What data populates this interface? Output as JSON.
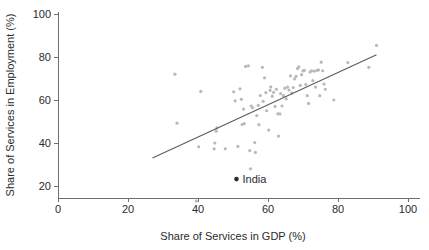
{
  "chart_data": {
    "type": "scatter",
    "title": "",
    "xlabel": "Share of Services in GDP (%)",
    "ylabel": "Share of Services in Employment (%)",
    "xlim": [
      0,
      100
    ],
    "ylim": [
      10,
      103
    ],
    "grid": false,
    "legend": null,
    "xticks": [
      0,
      20,
      40,
      60,
      80,
      100
    ],
    "yticks": [
      20,
      40,
      60,
      80,
      100
    ],
    "xtick_labels": [
      "0",
      "20",
      "40",
      "60",
      "80",
      "100"
    ],
    "ytick_labels": [
      "20",
      "40",
      "60",
      "80",
      "100"
    ],
    "point_color": "#b9b9b9",
    "highlight_color": "#2b2b2b",
    "line_color": "#5b5b66",
    "series": [
      {
        "name": "countries",
        "points": [
          [
            33.4,
            72.0
          ],
          [
            40.8,
            64.0
          ],
          [
            39.5,
            13.0
          ],
          [
            40.2,
            38.2
          ],
          [
            44.8,
            40.0
          ],
          [
            44.6,
            37.3
          ],
          [
            45.2,
            45.5
          ],
          [
            45.4,
            47.0
          ],
          [
            47.8,
            37.3
          ],
          [
            34.0,
            49.2
          ],
          [
            50.2,
            63.8
          ],
          [
            50.6,
            59.6
          ],
          [
            51.4,
            38.4
          ],
          [
            52.0,
            65.2
          ],
          [
            52.4,
            60.3
          ],
          [
            52.6,
            48.6
          ],
          [
            53.2,
            49.0
          ],
          [
            53.0,
            55.8
          ],
          [
            53.6,
            75.6
          ],
          [
            54.4,
            75.9
          ],
          [
            54.8,
            36.5
          ],
          [
            55.0,
            28.0
          ],
          [
            55.2,
            57.2
          ],
          [
            55.6,
            56.4
          ],
          [
            56.2,
            40.2
          ],
          [
            56.4,
            35.6
          ],
          [
            56.8,
            52.8
          ],
          [
            57.2,
            57.5
          ],
          [
            57.4,
            48.5
          ],
          [
            57.8,
            62.1
          ],
          [
            58.4,
            75.2
          ],
          [
            58.6,
            59.4
          ],
          [
            59.0,
            70.3
          ],
          [
            59.4,
            63.4
          ],
          [
            59.6,
            55.0
          ],
          [
            60.2,
            46.0
          ],
          [
            60.6,
            64.5
          ],
          [
            60.8,
            66.1
          ],
          [
            61.2,
            61.8
          ],
          [
            61.6,
            63.6
          ],
          [
            62.0,
            57.0
          ],
          [
            62.4,
            65.0
          ],
          [
            62.8,
            53.6
          ],
          [
            63.0,
            43.2
          ],
          [
            63.4,
            53.5
          ],
          [
            63.6,
            63.0
          ],
          [
            64.0,
            57.2
          ],
          [
            64.4,
            62.0
          ],
          [
            64.8,
            65.5
          ],
          [
            65.2,
            60.5
          ],
          [
            65.6,
            66.0
          ],
          [
            66.0,
            64.6
          ],
          [
            66.4,
            71.2
          ],
          [
            66.8,
            63.2
          ],
          [
            67.2,
            65.8
          ],
          [
            67.6,
            69.8
          ],
          [
            68.0,
            71.0
          ],
          [
            68.4,
            74.6
          ],
          [
            68.8,
            75.4
          ],
          [
            69.2,
            66.8
          ],
          [
            69.6,
            71.8
          ],
          [
            70.0,
            73.5
          ],
          [
            70.4,
            73.8
          ],
          [
            70.8,
            67.2
          ],
          [
            71.2,
            62.0
          ],
          [
            71.6,
            58.4
          ],
          [
            72.0,
            73.0
          ],
          [
            72.4,
            73.6
          ],
          [
            72.8,
            69.0
          ],
          [
            73.2,
            73.4
          ],
          [
            73.6,
            66.0
          ],
          [
            74.0,
            73.8
          ],
          [
            74.4,
            74.0
          ],
          [
            74.8,
            62.0
          ],
          [
            75.2,
            77.6
          ],
          [
            75.6,
            73.6
          ],
          [
            76.0,
            67.4
          ],
          [
            76.4,
            65.0
          ],
          [
            78.8,
            60.0
          ],
          [
            82.8,
            77.4
          ],
          [
            88.8,
            75.2
          ],
          [
            91.0,
            85.4
          ]
        ]
      }
    ],
    "highlight_points": [
      {
        "label": "India",
        "x": 51.0,
        "y": 23.2
      }
    ],
    "fit_line": {
      "x_start": 27.0,
      "y_start": 33.0,
      "x_end": 91.0,
      "y_end": 81.0
    }
  }
}
